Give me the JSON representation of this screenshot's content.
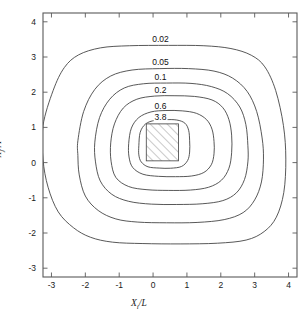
{
  "figure": {
    "kind": "contour-plot",
    "background": "#ffffff",
    "frame_color": "#5a5a5a",
    "contour_color": "#3a3a3a"
  },
  "axes": {
    "x": {
      "label_main": "X",
      "label_sub": "i",
      "label_denom": "/L",
      "ticks": [
        "-3",
        "-2",
        "-1",
        "0",
        "1",
        "2",
        "3",
        "4"
      ],
      "tick_values": [
        -3,
        -2,
        -1,
        0,
        1,
        2,
        3,
        4
      ],
      "range": [
        -3.25,
        4.25
      ]
    },
    "y": {
      "label_main": "X",
      "label_sub": "j",
      "label_denom": "/A",
      "ticks": [
        "-3",
        "-2",
        "-1",
        "0",
        "1",
        "2",
        "3",
        "4"
      ],
      "tick_values": [
        -3,
        -2,
        -1,
        0,
        1,
        2,
        3,
        4
      ],
      "range": [
        -3.25,
        4.25
      ]
    }
  },
  "hatched_region": {
    "name": "source-footprint",
    "x_min": -0.2,
    "x_max": 0.75,
    "y_min": 0.05,
    "y_max": 1.1,
    "hatch_angle_deg": 45,
    "hatch_color": "#808080",
    "border_color": "#4a4a4a"
  },
  "chart_data": {
    "type": "contour",
    "title": "",
    "xlabel": "X_i/L",
    "ylabel": "X_j/A",
    "xlim": [
      -3.25,
      4.25
    ],
    "ylim": [
      -3.25,
      4.25
    ],
    "grid": false,
    "legend": "none",
    "labels_inline": true,
    "levels": [
      0.02,
      0.05,
      0.1,
      0.2,
      0.6,
      3.8
    ],
    "level_labels": [
      "0.02",
      "0.05",
      "0.1",
      "0.2",
      "0.6",
      "3.8"
    ],
    "label_positions": [
      {
        "level": "0.02",
        "x": 0.22,
        "y": 3.52
      },
      {
        "level": "0.05",
        "x": 0.22,
        "y": 2.86
      },
      {
        "level": "0.1",
        "x": 0.22,
        "y": 2.43
      },
      {
        "level": "0.2",
        "x": 0.22,
        "y": 2.05
      },
      {
        "level": "0.6",
        "x": 0.22,
        "y": 1.62
      },
      {
        "level": "3.8",
        "x": 0.22,
        "y": 1.3
      }
    ],
    "contours": [
      {
        "level": "0.02",
        "clipped_at_frame": true,
        "extent": {
          "x_min": -3.25,
          "x_max": 4.25,
          "y_min": -2.3,
          "y_max": 3.32
        },
        "points": [
          [
            -3.25,
            1.05
          ],
          [
            -2.95,
            2.05
          ],
          [
            -2.62,
            2.7
          ],
          [
            -2.2,
            3.06
          ],
          [
            -1.55,
            3.26
          ],
          [
            -0.7,
            3.32
          ],
          [
            0.45,
            3.33
          ],
          [
            1.5,
            3.32
          ],
          [
            2.3,
            3.24
          ],
          [
            2.9,
            3.05
          ],
          [
            3.3,
            2.72
          ],
          [
            3.62,
            2.05
          ],
          [
            3.85,
            1.05
          ],
          [
            3.92,
            0.1
          ],
          [
            3.86,
            -0.85
          ],
          [
            3.64,
            -1.55
          ],
          [
            3.28,
            -1.96
          ],
          [
            2.75,
            -2.2
          ],
          [
            1.9,
            -2.29
          ],
          [
            0.8,
            -2.31
          ],
          [
            -0.3,
            -2.3
          ],
          [
            -1.2,
            -2.26
          ],
          [
            -1.85,
            -2.12
          ],
          [
            -2.35,
            -1.85
          ],
          [
            -2.8,
            -1.4
          ],
          [
            -3.1,
            -0.7
          ],
          [
            -3.25,
            0.1
          ]
        ]
      },
      {
        "level": "0.05",
        "clipped_at_frame": false,
        "extent": {
          "x_min": -2.22,
          "x_max": 3.26,
          "y_min": -1.68,
          "y_max": 2.68
        },
        "points": [
          [
            -2.22,
            0.62
          ],
          [
            -2.05,
            1.45
          ],
          [
            -1.72,
            2.08
          ],
          [
            -1.25,
            2.46
          ],
          [
            -0.62,
            2.63
          ],
          [
            0.2,
            2.67
          ],
          [
            1.05,
            2.67
          ],
          [
            1.8,
            2.6
          ],
          [
            2.35,
            2.4
          ],
          [
            2.78,
            2.02
          ],
          [
            3.06,
            1.45
          ],
          [
            3.22,
            0.7
          ],
          [
            3.26,
            0.1
          ],
          [
            3.2,
            -0.55
          ],
          [
            3.0,
            -1.06
          ],
          [
            2.66,
            -1.42
          ],
          [
            2.1,
            -1.62
          ],
          [
            1.3,
            -1.7
          ],
          [
            0.4,
            -1.71
          ],
          [
            -0.45,
            -1.69
          ],
          [
            -1.1,
            -1.6
          ],
          [
            -1.62,
            -1.36
          ],
          [
            -2.0,
            -0.95
          ],
          [
            -2.18,
            -0.35
          ],
          [
            -2.22,
            0.2
          ]
        ]
      },
      {
        "level": "0.1",
        "clipped_at_frame": false,
        "extent": {
          "x_min": -1.72,
          "x_max": 2.8,
          "y_min": -1.18,
          "y_max": 2.26
        },
        "points": [
          [
            -1.72,
            0.58
          ],
          [
            -1.58,
            1.28
          ],
          [
            -1.28,
            1.8
          ],
          [
            -0.85,
            2.12
          ],
          [
            -0.28,
            2.24
          ],
          [
            0.4,
            2.26
          ],
          [
            1.12,
            2.25
          ],
          [
            1.72,
            2.16
          ],
          [
            2.2,
            1.96
          ],
          [
            2.56,
            1.58
          ],
          [
            2.74,
            1.08
          ],
          [
            2.8,
            0.48
          ],
          [
            2.8,
            0.02
          ],
          [
            2.7,
            -0.48
          ],
          [
            2.46,
            -0.86
          ],
          [
            2.06,
            -1.08
          ],
          [
            1.45,
            -1.17
          ],
          [
            0.7,
            -1.19
          ],
          [
            -0.05,
            -1.18
          ],
          [
            -0.72,
            -1.1
          ],
          [
            -1.22,
            -0.9
          ],
          [
            -1.56,
            -0.52
          ],
          [
            -1.7,
            0.02
          ]
        ]
      },
      {
        "level": "0.2",
        "clipped_at_frame": false,
        "extent": {
          "x_min": -1.25,
          "x_max": 2.32,
          "y_min": -0.78,
          "y_max": 1.9
        },
        "points": [
          [
            -1.25,
            0.56
          ],
          [
            -1.14,
            1.1
          ],
          [
            -0.88,
            1.55
          ],
          [
            -0.48,
            1.8
          ],
          [
            0.05,
            1.89
          ],
          [
            0.62,
            1.9
          ],
          [
            1.22,
            1.88
          ],
          [
            1.74,
            1.78
          ],
          [
            2.06,
            1.56
          ],
          [
            2.24,
            1.22
          ],
          [
            2.32,
            0.78
          ],
          [
            2.32,
            0.28
          ],
          [
            2.24,
            -0.16
          ],
          [
            2.02,
            -0.5
          ],
          [
            1.64,
            -0.7
          ],
          [
            1.1,
            -0.78
          ],
          [
            0.45,
            -0.79
          ],
          [
            -0.18,
            -0.77
          ],
          [
            -0.72,
            -0.68
          ],
          [
            -1.1,
            -0.42
          ],
          [
            -1.24,
            0.04
          ]
        ]
      },
      {
        "level": "0.6",
        "clipped_at_frame": false,
        "extent": {
          "x_min": -0.72,
          "x_max": 1.8,
          "y_min": -0.4,
          "y_max": 1.48
        },
        "points": [
          [
            -0.72,
            0.54
          ],
          [
            -0.64,
            0.98
          ],
          [
            -0.42,
            1.28
          ],
          [
            -0.06,
            1.44
          ],
          [
            0.38,
            1.48
          ],
          [
            0.86,
            1.47
          ],
          [
            1.28,
            1.4
          ],
          [
            1.58,
            1.22
          ],
          [
            1.74,
            0.95
          ],
          [
            1.8,
            0.6
          ],
          [
            1.8,
            0.25
          ],
          [
            1.72,
            -0.06
          ],
          [
            1.5,
            -0.28
          ],
          [
            1.14,
            -0.38
          ],
          [
            0.66,
            -0.4
          ],
          [
            0.16,
            -0.39
          ],
          [
            -0.3,
            -0.33
          ],
          [
            -0.6,
            -0.14
          ],
          [
            -0.71,
            0.16
          ]
        ]
      },
      {
        "level": "3.8",
        "clipped_at_frame": false,
        "extent": {
          "x_min": -0.42,
          "x_max": 1.08,
          "y_min": -0.16,
          "y_max": 1.22
        },
        "points": [
          [
            -0.42,
            0.48
          ],
          [
            -0.38,
            0.86
          ],
          [
            -0.22,
            1.1
          ],
          [
            0.05,
            1.2
          ],
          [
            0.36,
            1.22
          ],
          [
            0.7,
            1.21
          ],
          [
            0.94,
            1.12
          ],
          [
            1.05,
            0.92
          ],
          [
            1.08,
            0.62
          ],
          [
            1.08,
            0.3
          ],
          [
            1.02,
            0.06
          ],
          [
            0.84,
            -0.11
          ],
          [
            0.52,
            -0.16
          ],
          [
            0.18,
            -0.155
          ],
          [
            -0.15,
            -0.12
          ],
          [
            -0.35,
            0.02
          ],
          [
            -0.42,
            0.22
          ]
        ]
      }
    ]
  }
}
